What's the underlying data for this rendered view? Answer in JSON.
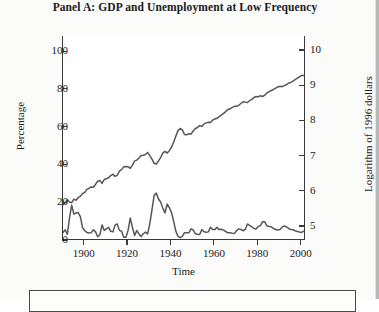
{
  "figure": {
    "title": "Panel A: GDP and Unemployment at Low Frequency",
    "background": "#fbfbfa",
    "plot_background": "#ffffff",
    "line_color": "#565656",
    "axis_color": "#3a3a3a"
  },
  "chart_data": {
    "type": "line",
    "title": "Panel A: GDP and Unemployment at Low Frequency",
    "xlabel": "Time",
    "ylabel": "Percentage",
    "ylabel_right": "Logarithm of 1996 dollars",
    "xlim": [
      1890,
      2002
    ],
    "ylim": [
      0,
      108
    ],
    "ylim_right": [
      4.6,
      10.4
    ],
    "xticks": [
      1900,
      1920,
      1940,
      1960,
      1980,
      2000
    ],
    "xtick_labels": [
      "1900",
      "1920",
      "1940",
      "1960",
      "1980",
      "2000"
    ],
    "yticks": [
      0,
      20,
      40,
      60,
      80,
      100
    ],
    "ytick_labels": [
      "0",
      "20",
      "40",
      "60",
      "80",
      "100"
    ],
    "yticks_right": [
      5,
      6,
      7,
      8,
      9,
      10
    ],
    "ytick_labels_right": [
      "5",
      "6",
      "7",
      "8",
      "9",
      "10"
    ],
    "grid": false,
    "legend_position": "below-plot",
    "series": [
      {
        "name": "GDP (log of 1996 dollars)",
        "axis": "right",
        "color": "#565656",
        "x": [
          1890,
          1891,
          1892,
          1893,
          1894,
          1895,
          1896,
          1897,
          1898,
          1899,
          1900,
          1901,
          1902,
          1903,
          1904,
          1905,
          1906,
          1907,
          1908,
          1909,
          1910,
          1911,
          1912,
          1913,
          1914,
          1915,
          1916,
          1917,
          1918,
          1919,
          1920,
          1921,
          1922,
          1923,
          1924,
          1925,
          1926,
          1927,
          1928,
          1929,
          1930,
          1931,
          1932,
          1933,
          1934,
          1935,
          1936,
          1937,
          1938,
          1939,
          1940,
          1941,
          1942,
          1943,
          1944,
          1945,
          1946,
          1947,
          1948,
          1949,
          1950,
          1951,
          1952,
          1953,
          1954,
          1955,
          1956,
          1957,
          1958,
          1959,
          1960,
          1961,
          1962,
          1963,
          1964,
          1965,
          1966,
          1967,
          1968,
          1969,
          1970,
          1971,
          1972,
          1973,
          1974,
          1975,
          1976,
          1977,
          1978,
          1979,
          1980,
          1981,
          1982,
          1983,
          1984,
          1985,
          1986,
          1987,
          1988,
          1989,
          1990,
          1991,
          1992,
          1993,
          1994,
          1995,
          1996,
          1997,
          1998,
          1999,
          2000,
          2001
        ],
        "values": [
          5.6,
          5.66,
          5.74,
          5.68,
          5.66,
          5.76,
          5.73,
          5.81,
          5.84,
          5.92,
          5.95,
          6.04,
          6.07,
          6.11,
          6.1,
          6.18,
          6.27,
          6.29,
          6.21,
          6.32,
          6.34,
          6.37,
          6.43,
          6.47,
          6.41,
          6.44,
          6.56,
          6.6,
          6.68,
          6.69,
          6.68,
          6.64,
          6.73,
          6.85,
          6.87,
          6.93,
          7.0,
          7.01,
          7.03,
          7.09,
          7.0,
          6.9,
          6.78,
          6.76,
          6.85,
          6.94,
          7.07,
          7.12,
          7.07,
          7.14,
          7.24,
          7.38,
          7.55,
          7.71,
          7.77,
          7.73,
          7.6,
          7.59,
          7.62,
          7.61,
          7.7,
          7.77,
          7.8,
          7.85,
          7.83,
          7.9,
          7.93,
          7.95,
          7.94,
          8.01,
          8.04,
          8.06,
          8.11,
          8.15,
          8.2,
          8.25,
          8.31,
          8.33,
          8.37,
          8.4,
          8.4,
          8.43,
          8.48,
          8.53,
          8.52,
          8.51,
          8.56,
          8.6,
          8.65,
          8.68,
          8.67,
          8.7,
          8.68,
          8.72,
          8.78,
          8.82,
          8.85,
          8.88,
          8.92,
          8.95,
          8.97,
          8.96,
          8.99,
          9.02,
          9.06,
          9.08,
          9.12,
          9.16,
          9.2,
          9.24,
          9.28,
          9.28
        ]
      },
      {
        "name": "Unemployment rate (percentage)",
        "axis": "left",
        "color": "#565656",
        "x": [
          1890,
          1891,
          1892,
          1893,
          1894,
          1895,
          1896,
          1897,
          1898,
          1899,
          1900,
          1901,
          1902,
          1903,
          1904,
          1905,
          1906,
          1907,
          1908,
          1909,
          1910,
          1911,
          1912,
          1913,
          1914,
          1915,
          1916,
          1917,
          1918,
          1919,
          1920,
          1921,
          1922,
          1923,
          1924,
          1925,
          1926,
          1927,
          1928,
          1929,
          1930,
          1931,
          1932,
          1933,
          1934,
          1935,
          1936,
          1937,
          1938,
          1939,
          1940,
          1941,
          1942,
          1943,
          1944,
          1945,
          1946,
          1947,
          1948,
          1949,
          1950,
          1951,
          1952,
          1953,
          1954,
          1955,
          1956,
          1957,
          1958,
          1959,
          1960,
          1961,
          1962,
          1963,
          1964,
          1965,
          1966,
          1967,
          1968,
          1969,
          1970,
          1971,
          1972,
          1973,
          1974,
          1975,
          1976,
          1977,
          1978,
          1979,
          1980,
          1981,
          1982,
          1983,
          1984,
          1985,
          1986,
          1987,
          1988,
          1989,
          1990,
          1991,
          1992,
          1993,
          1994,
          1995,
          1996,
          1997,
          1998,
          1999,
          2000,
          2001
        ],
        "values": [
          4.0,
          5.4,
          3.0,
          11.7,
          18.4,
          13.7,
          14.4,
          14.5,
          12.4,
          6.5,
          5.0,
          4.0,
          3.7,
          3.9,
          5.4,
          4.3,
          1.7,
          2.8,
          8.0,
          5.1,
          5.9,
          6.7,
          4.6,
          4.3,
          7.9,
          8.5,
          5.1,
          4.6,
          1.4,
          1.4,
          5.2,
          11.7,
          6.7,
          2.4,
          5.0,
          3.2,
          1.8,
          3.3,
          4.2,
          3.2,
          8.7,
          15.9,
          23.6,
          24.9,
          21.7,
          20.1,
          16.9,
          14.3,
          19.0,
          17.2,
          14.6,
          9.9,
          4.7,
          1.9,
          1.2,
          1.9,
          3.9,
          3.9,
          3.8,
          5.9,
          5.3,
          3.3,
          3.0,
          2.9,
          5.5,
          4.4,
          4.1,
          4.3,
          6.8,
          5.5,
          5.5,
          6.7,
          5.5,
          5.7,
          5.2,
          4.5,
          3.8,
          3.8,
          3.6,
          3.5,
          4.9,
          5.9,
          5.6,
          4.9,
          5.6,
          8.5,
          7.7,
          7.1,
          6.1,
          5.8,
          7.1,
          7.6,
          9.7,
          9.6,
          7.5,
          7.2,
          7.0,
          6.2,
          5.5,
          5.3,
          5.6,
          6.8,
          7.5,
          6.9,
          6.1,
          5.6,
          5.4,
          4.9,
          4.5,
          4.2,
          4.0,
          4.7
        ]
      }
    ]
  }
}
